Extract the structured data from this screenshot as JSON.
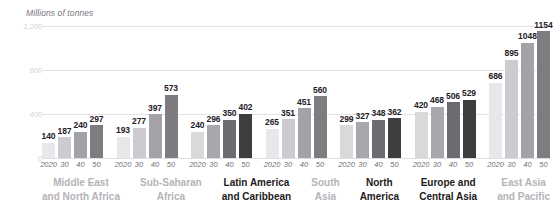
{
  "chart_data": {
    "type": "bar",
    "title": "Millions of tonnes",
    "xlabel": "",
    "ylabel": "Millions of tonnes",
    "ylim": [
      0,
      1200
    ],
    "yticks": [
      "0",
      "400",
      "800",
      "1,200"
    ],
    "ytick_values": [
      0,
      400,
      800,
      1200
    ],
    "grid": true,
    "legend": "none",
    "x": [
      "2020",
      "30",
      "40",
      "50"
    ],
    "categories": [
      "Middle East and North Africa",
      "Sub-Saharan Africa",
      "Latin America and Caribbean",
      "South Asia",
      "North America",
      "Europe and Central Asia",
      "East Asia and Pacific"
    ],
    "groups": [
      {
        "label_line1": "Middle East",
        "label_line2": "and North Africa",
        "highlight": false,
        "values": [
          140,
          187,
          240,
          297
        ]
      },
      {
        "label_line1": "Sub-Saharan",
        "label_line2": "Africa",
        "highlight": false,
        "values": [
          193,
          277,
          397,
          573
        ]
      },
      {
        "label_line1": "Latin America",
        "label_line2": "and Caribbean",
        "highlight": true,
        "values": [
          240,
          296,
          350,
          402
        ]
      },
      {
        "label_line1": "South",
        "label_line2": "Asia",
        "highlight": false,
        "values": [
          265,
          351,
          451,
          560
        ]
      },
      {
        "label_line1": "North",
        "label_line2": "America",
        "highlight": true,
        "values": [
          299,
          327,
          348,
          362
        ]
      },
      {
        "label_line1": "Europe and",
        "label_line2": "Central Asia",
        "highlight": true,
        "values": [
          420,
          468,
          506,
          529
        ]
      },
      {
        "label_line1": "East Asia",
        "label_line2": "and Pacific",
        "highlight": false,
        "values": [
          686,
          895,
          1048,
          1154
        ]
      }
    ],
    "series": [
      {
        "name": "2020",
        "values": [
          140,
          193,
          240,
          265,
          299,
          420,
          686
        ]
      },
      {
        "name": "30",
        "values": [
          187,
          277,
          296,
          351,
          327,
          468,
          895
        ]
      },
      {
        "name": "40",
        "values": [
          240,
          397,
          350,
          451,
          348,
          506,
          1048
        ]
      },
      {
        "name": "50",
        "values": [
          297,
          573,
          402,
          560,
          362,
          529,
          1154
        ]
      }
    ]
  },
  "style": {
    "bar_colors_normal": [
      "#e9e7ea",
      "#cdcbd0",
      "#a4a2a7",
      "#7e7c81"
    ],
    "bar_colors_highlight": [
      "#dad8db",
      "#a9a7ac",
      "#6d6b70",
      "#3f3d40"
    ],
    "grid_color": "#e3e1e4",
    "value_label_color": "#23201f",
    "tick_color": "#6f6d72",
    "group_label_color": "#b6b3b8",
    "group_label_highlight_color": "#1c1a1b",
    "axis_title_color": "#77757a"
  }
}
